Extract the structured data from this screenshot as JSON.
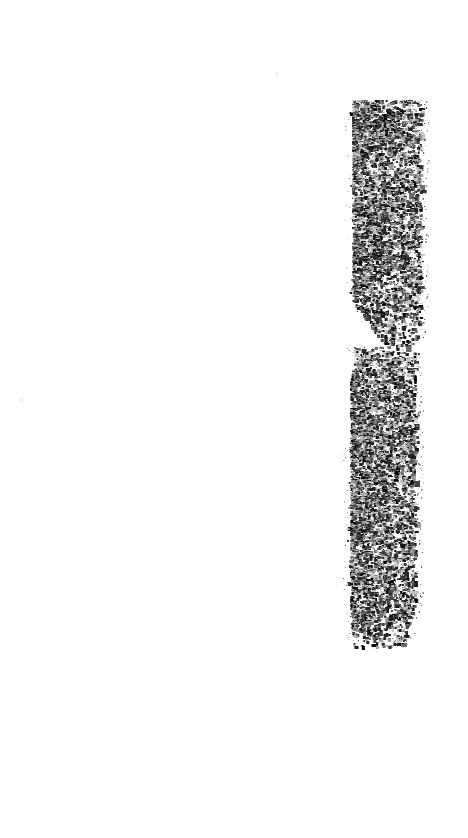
{
  "document": {
    "kind": "degraded-scan",
    "page_width": 468,
    "page_height": 838,
    "background_color": "#ffffff",
    "ink_color": "#141414",
    "description": "Blank scanned page with a single vertical band of dense black speckle noise near the right edge, broken into two blocks by a horizontal gap.",
    "legible_text": "",
    "text_content": ""
  },
  "chart_data": {
    "type": "heatmap",
    "title": "",
    "xlabel": "",
    "ylabel": "",
    "grid": false,
    "legend_position": "none",
    "xlim": [
      0,
      468
    ],
    "ylim": [
      0,
      838
    ],
    "note": "Ink-density map of the speckle band; each region lists its bounding box and fill density (fraction of dark pixels).",
    "regions": [
      {
        "name": "upper-block",
        "x": 352,
        "y": 100,
        "width": 68,
        "height": 245,
        "density": 0.3,
        "shape": "rect-tapered-bottom-left"
      },
      {
        "name": "gap",
        "x": 352,
        "y": 345,
        "width": 68,
        "height": 9,
        "density": 0.02,
        "shape": "rect"
      },
      {
        "name": "lower-block",
        "x": 350,
        "y": 354,
        "width": 65,
        "height": 291,
        "density": 0.33,
        "shape": "rect-tapered-bottom"
      }
    ],
    "density_profile": {
      "ylabel": "ink density",
      "xlabel": "y position (px)",
      "y_positions": [
        100,
        130,
        160,
        190,
        220,
        250,
        280,
        310,
        340,
        355,
        380,
        410,
        440,
        470,
        500,
        530,
        560,
        590,
        620,
        645
      ],
      "values": [
        0.3,
        0.33,
        0.31,
        0.28,
        0.3,
        0.32,
        0.29,
        0.24,
        0.12,
        0.22,
        0.3,
        0.34,
        0.36,
        0.32,
        0.35,
        0.31,
        0.33,
        0.3,
        0.26,
        0.1
      ]
    },
    "isolated_marks": [
      {
        "name": "dark-fleck",
        "x": 414,
        "y": 375,
        "width": 3,
        "height": 9,
        "color": "#101010"
      },
      {
        "name": "faint-speck-left",
        "x": 20,
        "y": 398,
        "width": 3,
        "height": 4,
        "color": "#ededed"
      },
      {
        "name": "faint-speck-upper",
        "x": 275,
        "y": 72,
        "width": 4,
        "height": 5,
        "color": "#f2f2f2"
      }
    ]
  },
  "render": {
    "seed": 20240617,
    "band_left": 350,
    "band_right": 421,
    "upper_top": 100,
    "upper_bottom": 346,
    "lower_top": 352,
    "lower_bottom": 646,
    "dot_min": 1,
    "dot_max": 3,
    "shades": [
      "#000000",
      "#121212",
      "#1f1f1f",
      "#2e2e2e",
      "#454545",
      "#6b6b6b",
      "#9a9a9a",
      "#c4c4c4"
    ]
  }
}
